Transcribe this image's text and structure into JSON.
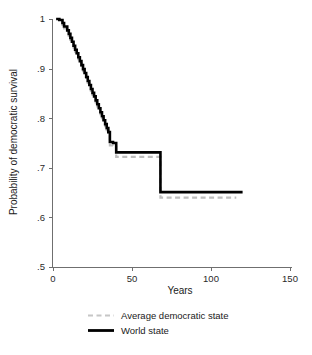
{
  "chart_data": {
    "type": "line",
    "title": "",
    "subtitle": "",
    "xlabel": "Years",
    "ylabel": "Probability of democratic survival",
    "xlim": [
      0,
      150
    ],
    "ylim": [
      0.5,
      1.0
    ],
    "xticks": [
      0,
      50,
      100,
      150
    ],
    "xtick_labels": [
      "0",
      "50",
      "100",
      "150"
    ],
    "yticks": [
      0.5,
      0.6,
      0.7,
      0.8,
      0.9,
      1.0
    ],
    "ytick_labels": [
      ".5",
      ".6",
      ".7",
      ".8",
      ".9",
      "1"
    ],
    "grid": false,
    "legend_position": "below",
    "curve_style": "step-post",
    "series": [
      {
        "name": "Average democratic state",
        "color": "#bdbdbd",
        "style": "dashed",
        "x": [
          2,
          4,
          6,
          7,
          9,
          10,
          11,
          12,
          13,
          14,
          15,
          16,
          17,
          18,
          19,
          20,
          21,
          22,
          23,
          24,
          25,
          26,
          27,
          28,
          29,
          30,
          31,
          32,
          33,
          34,
          35,
          36,
          38,
          40,
          67,
          68,
          116
        ],
        "y": [
          1.0,
          0.995,
          0.988,
          0.981,
          0.973,
          0.966,
          0.958,
          0.95,
          0.942,
          0.934,
          0.927,
          0.919,
          0.911,
          0.903,
          0.895,
          0.887,
          0.879,
          0.871,
          0.863,
          0.855,
          0.847,
          0.84,
          0.832,
          0.824,
          0.816,
          0.808,
          0.8,
          0.792,
          0.784,
          0.776,
          0.768,
          0.745,
          0.742,
          0.722,
          0.722,
          0.64,
          0.64
        ]
      },
      {
        "name": "World state",
        "color": "#000000",
        "style": "solid",
        "x": [
          2,
          4,
          6,
          7,
          9,
          10,
          11,
          12,
          13,
          14,
          15,
          16,
          17,
          18,
          19,
          20,
          21,
          22,
          23,
          24,
          25,
          26,
          27,
          28,
          29,
          30,
          31,
          32,
          33,
          34,
          35,
          36,
          38,
          40,
          67,
          68,
          120
        ],
        "y": [
          1.0,
          0.998,
          0.992,
          0.985,
          0.977,
          0.97,
          0.962,
          0.954,
          0.946,
          0.938,
          0.931,
          0.923,
          0.915,
          0.907,
          0.899,
          0.891,
          0.883,
          0.875,
          0.867,
          0.859,
          0.851,
          0.844,
          0.836,
          0.828,
          0.82,
          0.812,
          0.804,
          0.796,
          0.788,
          0.78,
          0.772,
          0.752,
          0.75,
          0.731,
          0.731,
          0.651,
          0.651
        ]
      }
    ],
    "annotations": []
  },
  "legend": {
    "items": [
      {
        "label": "Average democratic state"
      },
      {
        "label": "World state"
      }
    ]
  },
  "colors": {
    "axis": "#6f6f6f",
    "text": "#1a1a1a",
    "world_state": "#000000",
    "average_democratic_state": "#bdbdbd",
    "background": "#ffffff"
  }
}
